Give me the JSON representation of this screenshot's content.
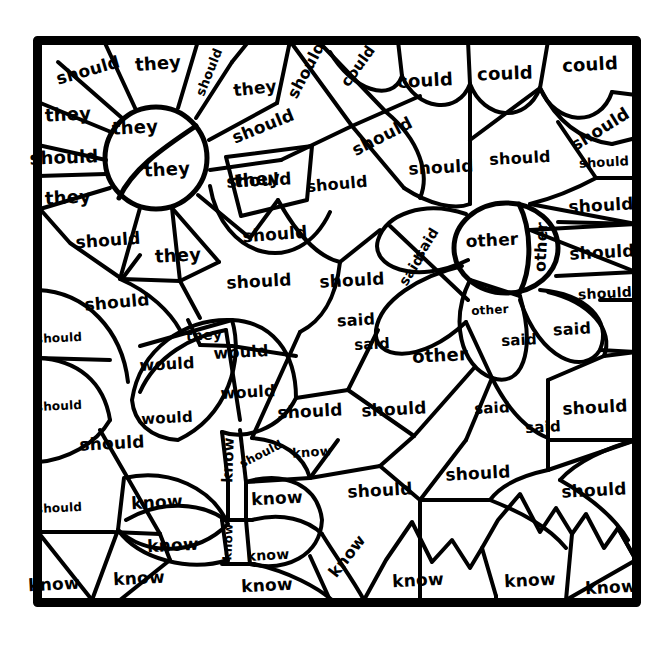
{
  "page": {
    "type": "color-by-sight-word-coloring-worksheet",
    "background_color": "#ffffff",
    "ink_color": "#000000",
    "border": {
      "x": 33,
      "y": 36,
      "width": 608,
      "height": 571,
      "stroke_width": 9
    }
  },
  "sight_words": [
    "they",
    "should",
    "could",
    "said",
    "other",
    "would",
    "know"
  ],
  "word_counts": {
    "they": 8,
    "should": 35,
    "could": 5,
    "said": 11,
    "other": 4,
    "would": 4,
    "know": 15
  },
  "regions": [
    {
      "word": "should",
      "x": 88,
      "y": 70,
      "size": 17,
      "rot": -16
    },
    {
      "word": "they",
      "x": 158,
      "y": 63,
      "size": 18,
      "rot": -4
    },
    {
      "word": "should",
      "x": 209,
      "y": 72,
      "size": 13,
      "rot": -68
    },
    {
      "word": "they",
      "x": 255,
      "y": 88,
      "size": 17,
      "rot": -6
    },
    {
      "word": "should",
      "x": 306,
      "y": 70,
      "size": 16,
      "rot": -62
    },
    {
      "word": "could",
      "x": 358,
      "y": 66,
      "size": 15,
      "rot": -54
    },
    {
      "word": "could",
      "x": 425,
      "y": 80,
      "size": 18,
      "rot": -3
    },
    {
      "word": "could",
      "x": 505,
      "y": 73,
      "size": 18,
      "rot": -2
    },
    {
      "word": "could",
      "x": 590,
      "y": 64,
      "size": 18,
      "rot": -3
    },
    {
      "word": "they",
      "x": 68,
      "y": 114,
      "size": 18,
      "rot": -3
    },
    {
      "word": "they",
      "x": 135,
      "y": 127,
      "size": 18,
      "rot": -3
    },
    {
      "word": "should",
      "x": 263,
      "y": 126,
      "size": 17,
      "rot": -22
    },
    {
      "word": "should",
      "x": 382,
      "y": 136,
      "size": 17,
      "rot": -27
    },
    {
      "word": "should",
      "x": 600,
      "y": 129,
      "size": 17,
      "rot": -32
    },
    {
      "word": "should",
      "x": 64,
      "y": 157,
      "size": 18,
      "rot": -2
    },
    {
      "word": "they",
      "x": 167,
      "y": 169,
      "size": 18,
      "rot": -3
    },
    {
      "word": "should",
      "x": 259,
      "y": 180,
      "size": 17,
      "rot": -3
    },
    {
      "word": "they",
      "x": 257,
      "y": 179,
      "size": 18,
      "rot": -5
    },
    {
      "word": "should",
      "x": 337,
      "y": 184,
      "size": 16,
      "rot": -5
    },
    {
      "word": "should",
      "x": 441,
      "y": 167,
      "size": 17,
      "rot": -3
    },
    {
      "word": "should",
      "x": 520,
      "y": 158,
      "size": 16,
      "rot": -3
    },
    {
      "word": "should",
      "x": 604,
      "y": 162,
      "size": 13,
      "rot": -3
    },
    {
      "word": "they",
      "x": 68,
      "y": 197,
      "size": 18,
      "rot": -3
    },
    {
      "word": "should",
      "x": 601,
      "y": 205,
      "size": 17,
      "rot": -3
    },
    {
      "word": "should",
      "x": 108,
      "y": 240,
      "size": 17,
      "rot": -4
    },
    {
      "word": "should",
      "x": 275,
      "y": 234,
      "size": 17,
      "rot": -4
    },
    {
      "word": "said",
      "x": 426,
      "y": 243,
      "size": 14,
      "rot": -58
    },
    {
      "word": "other",
      "x": 492,
      "y": 240,
      "size": 17,
      "rot": -3
    },
    {
      "word": "other",
      "x": 541,
      "y": 247,
      "size": 16,
      "rot": -87
    },
    {
      "word": "should",
      "x": 602,
      "y": 252,
      "size": 17,
      "rot": -3
    },
    {
      "word": "they",
      "x": 178,
      "y": 255,
      "size": 18,
      "rot": -3
    },
    {
      "word": "said",
      "x": 411,
      "y": 270,
      "size": 14,
      "rot": -58
    },
    {
      "word": "should",
      "x": 259,
      "y": 281,
      "size": 17,
      "rot": -3
    },
    {
      "word": "should",
      "x": 352,
      "y": 280,
      "size": 17,
      "rot": -3
    },
    {
      "word": "should",
      "x": 605,
      "y": 293,
      "size": 14,
      "rot": -3
    },
    {
      "word": "should",
      "x": 117,
      "y": 302,
      "size": 17,
      "rot": -5
    },
    {
      "word": "said",
      "x": 356,
      "y": 320,
      "size": 16,
      "rot": -3
    },
    {
      "word": "other",
      "x": 490,
      "y": 310,
      "size": 12,
      "rot": -3
    },
    {
      "word": "said",
      "x": 519,
      "y": 340,
      "size": 15,
      "rot": -3
    },
    {
      "word": "said",
      "x": 572,
      "y": 329,
      "size": 16,
      "rot": -3
    },
    {
      "word": "should",
      "x": 59,
      "y": 338,
      "size": 12,
      "rot": -3
    },
    {
      "word": "they",
      "x": 204,
      "y": 335,
      "size": 14,
      "rot": -3
    },
    {
      "word": "would",
      "x": 241,
      "y": 352,
      "size": 16,
      "rot": -3
    },
    {
      "word": "said",
      "x": 372,
      "y": 344,
      "size": 15,
      "rot": -3
    },
    {
      "word": "other",
      "x": 440,
      "y": 355,
      "size": 18,
      "rot": -3
    },
    {
      "word": "would",
      "x": 167,
      "y": 364,
      "size": 16,
      "rot": -3
    },
    {
      "word": "would",
      "x": 248,
      "y": 392,
      "size": 16,
      "rot": -3
    },
    {
      "word": "should",
      "x": 59,
      "y": 406,
      "size": 12,
      "rot": -3
    },
    {
      "word": "would",
      "x": 167,
      "y": 418,
      "size": 15,
      "rot": -3
    },
    {
      "word": "should",
      "x": 310,
      "y": 411,
      "size": 17,
      "rot": -3
    },
    {
      "word": "should",
      "x": 394,
      "y": 409,
      "size": 17,
      "rot": -3
    },
    {
      "word": "said",
      "x": 492,
      "y": 408,
      "size": 15,
      "rot": -3
    },
    {
      "word": "should",
      "x": 595,
      "y": 407,
      "size": 17,
      "rot": -3
    },
    {
      "word": "said",
      "x": 543,
      "y": 427,
      "size": 15,
      "rot": -3
    },
    {
      "word": "should",
      "x": 112,
      "y": 443,
      "size": 17,
      "rot": -3
    },
    {
      "word": "know",
      "x": 228,
      "y": 460,
      "size": 15,
      "rot": -88
    },
    {
      "word": "should",
      "x": 261,
      "y": 454,
      "size": 12,
      "rot": -27
    },
    {
      "word": "know",
      "x": 312,
      "y": 452,
      "size": 13,
      "rot": -4
    },
    {
      "word": "should",
      "x": 478,
      "y": 473,
      "size": 17,
      "rot": -3
    },
    {
      "word": "should",
      "x": 380,
      "y": 490,
      "size": 17,
      "rot": -3
    },
    {
      "word": "should",
      "x": 594,
      "y": 490,
      "size": 17,
      "rot": -3
    },
    {
      "word": "should",
      "x": 59,
      "y": 508,
      "size": 12,
      "rot": -3
    },
    {
      "word": "know",
      "x": 157,
      "y": 502,
      "size": 17,
      "rot": -3
    },
    {
      "word": "know",
      "x": 277,
      "y": 498,
      "size": 17,
      "rot": -3
    },
    {
      "word": "know",
      "x": 228,
      "y": 542,
      "size": 12,
      "rot": -88
    },
    {
      "word": "know",
      "x": 173,
      "y": 545,
      "size": 17,
      "rot": -3
    },
    {
      "word": "know",
      "x": 268,
      "y": 555,
      "size": 14,
      "rot": -3
    },
    {
      "word": "know",
      "x": 347,
      "y": 556,
      "size": 16,
      "rot": -52
    },
    {
      "word": "know",
      "x": 54,
      "y": 584,
      "size": 17,
      "rot": -3
    },
    {
      "word": "know",
      "x": 139,
      "y": 578,
      "size": 17,
      "rot": -3
    },
    {
      "word": "know",
      "x": 267,
      "y": 585,
      "size": 17,
      "rot": -3
    },
    {
      "word": "know",
      "x": 418,
      "y": 580,
      "size": 17,
      "rot": -3
    },
    {
      "word": "know",
      "x": 530,
      "y": 580,
      "size": 17,
      "rot": -3
    },
    {
      "word": "know",
      "x": 611,
      "y": 587,
      "size": 17,
      "rot": -3
    }
  ]
}
